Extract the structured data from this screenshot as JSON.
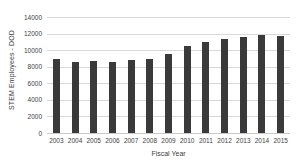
{
  "chart_data": {
    "type": "bar",
    "title": "",
    "xlabel": "Fiscal Year",
    "ylabel": "STEM Employees - DOD",
    "categories": [
      "2003",
      "2004",
      "2005",
      "2006",
      "2007",
      "2008",
      "2009",
      "2010",
      "2011",
      "2012",
      "2013",
      "2014",
      "2015"
    ],
    "values": [
      8900,
      8550,
      8700,
      8550,
      8800,
      8950,
      9500,
      10550,
      11000,
      11400,
      11550,
      11850,
      11750
    ],
    "ylim": [
      0,
      14000
    ],
    "yticks": [
      0,
      2000,
      4000,
      6000,
      8000,
      10000,
      12000,
      14000
    ],
    "ytick_labels": [
      "0",
      "2000",
      "4000",
      "6000",
      "8000",
      "10000",
      "12000",
      "14000"
    ],
    "grid": true,
    "legend": false,
    "bar_color": "#3a3a3a",
    "gridline_color": "#d9d9d9",
    "background": "#ffffff"
  }
}
